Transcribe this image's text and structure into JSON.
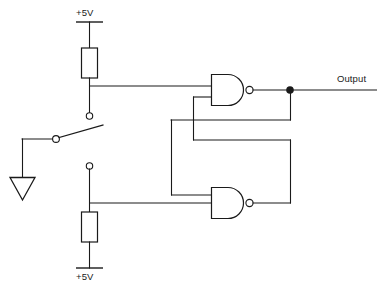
{
  "diagram": {
    "type": "schematic",
    "line_color": "#1a1a1a",
    "background_color": "#ffffff"
  },
  "labels": {
    "vcc_top": "+5V",
    "vcc_bottom": "+5V",
    "output": "Output"
  },
  "components": [
    {
      "id": "r1",
      "kind": "resistor",
      "orientation": "vertical",
      "connects": [
        "vcc_top",
        "nand1_input_a"
      ]
    },
    {
      "id": "r2",
      "kind": "resistor",
      "orientation": "vertical",
      "connects": [
        "vcc_bottom",
        "nand2_input_b"
      ]
    },
    {
      "id": "sw1",
      "kind": "spdt-switch",
      "position": "lower-contact",
      "connects": [
        "r1_node",
        "r2_node",
        "ground"
      ]
    },
    {
      "id": "gnd1",
      "kind": "ground",
      "symbol": "triangle"
    },
    {
      "id": "nand1",
      "kind": "nand-gate",
      "inputs": 2,
      "connects": [
        "r1_node",
        "nand2_output"
      ],
      "output": "output_node"
    },
    {
      "id": "nand2",
      "kind": "nand-gate",
      "inputs": 2,
      "connects": [
        "nand1_output",
        "r2_node"
      ],
      "output": "nand2_output"
    },
    {
      "id": "j1",
      "kind": "junction-dot",
      "connects": [
        "nand1_output",
        "output_terminal",
        "nand2_upper_input"
      ]
    }
  ]
}
